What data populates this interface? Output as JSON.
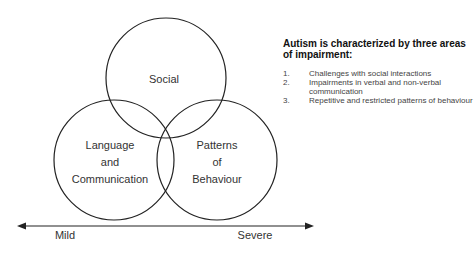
{
  "diagram": {
    "circles": [
      {
        "id": "social",
        "label_lines": [
          "Social"
        ]
      },
      {
        "id": "language",
        "label_lines": [
          "Language",
          "and",
          "Communication"
        ]
      },
      {
        "id": "patterns",
        "label_lines": [
          "Patterns",
          "of",
          "Behaviour"
        ]
      }
    ],
    "axis": {
      "left_label": "Mild",
      "right_label": "Severe"
    }
  },
  "panel": {
    "heading": "Autism is characterized by three areas of impairment:",
    "items": [
      {
        "num": "1.",
        "text": "Challenges with social interactions"
      },
      {
        "num": "2.",
        "text": "Impairments in verbal and non-verbal communication"
      },
      {
        "num": "3.",
        "text": "Repetitive and restricted patterns of behaviour"
      }
    ]
  },
  "colors": {
    "stroke": "#222222",
    "text": "#333333"
  }
}
